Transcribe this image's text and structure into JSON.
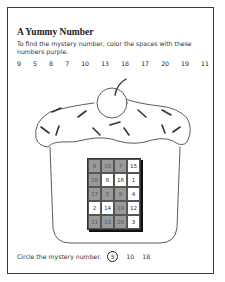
{
  "worksheet": {
    "title": "A Yummy Number",
    "instructions": "To find the mystery number, color the spaces with these numbers purple.",
    "numbers_to_color": [
      "9",
      "5",
      "8",
      "7",
      "10",
      "13",
      "18",
      "17",
      "20",
      "19",
      "11"
    ],
    "shade_color": "#9a9a9a",
    "grid": [
      [
        {
          "v": "8",
          "shaded": true
        },
        {
          "v": "10",
          "shaded": true
        },
        {
          "v": "7",
          "shaded": true
        },
        {
          "v": "15",
          "shaded": false
        }
      ],
      [
        {
          "v": "18",
          "shaded": true
        },
        {
          "v": "6",
          "shaded": false
        },
        {
          "v": "16",
          "shaded": false
        },
        {
          "v": "1",
          "shaded": false
        }
      ],
      [
        {
          "v": "17",
          "shaded": true
        },
        {
          "v": "5",
          "shaded": true
        },
        {
          "v": "9",
          "shaded": true
        },
        {
          "v": "4",
          "shaded": false
        }
      ],
      [
        {
          "v": "2",
          "shaded": false
        },
        {
          "v": "14",
          "shaded": false
        },
        {
          "v": "19",
          "shaded": true
        },
        {
          "v": "12",
          "shaded": false
        }
      ],
      [
        {
          "v": "11",
          "shaded": true
        },
        {
          "v": "13",
          "shaded": true
        },
        {
          "v": "20",
          "shaded": true
        },
        {
          "v": "3",
          "shaded": false
        }
      ]
    ],
    "answer_prompt": "Circle the mystery number.",
    "answer_options": [
      "5",
      "10",
      "18"
    ],
    "circled_answer": "5"
  }
}
